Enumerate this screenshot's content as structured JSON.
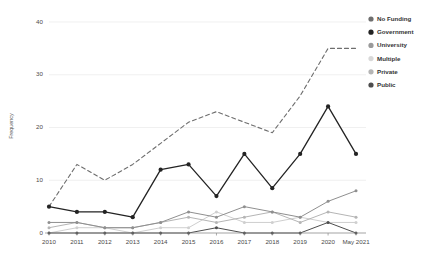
{
  "chart_data": {
    "type": "line",
    "title": "",
    "xlabel": "",
    "ylabel": "Frequency",
    "categories": [
      "2010",
      "2011",
      "2012",
      "2013",
      "2014",
      "2015",
      "2016",
      "2017",
      "2018",
      "2019",
      "2020",
      "May 2021"
    ],
    "ylim": [
      0,
      42
    ],
    "yticks": [
      0,
      10,
      20,
      30,
      40
    ],
    "ytick_labels": [
      "0",
      "10",
      "20",
      "30",
      "40"
    ],
    "grid": true,
    "legend_position": "right",
    "series": [
      {
        "name": "No Funding",
        "color": "#6e6e6e",
        "dash": "4,3",
        "width": 1.1,
        "marker": "none",
        "values": [
          5,
          13,
          10,
          13,
          17,
          21,
          23,
          21,
          19,
          26,
          35,
          35
        ]
      },
      {
        "name": "Government",
        "color": "#232323",
        "dash": "none",
        "width": 1.3,
        "marker": "circle",
        "values": [
          5,
          4,
          4,
          3,
          12,
          13,
          7,
          15,
          8.5,
          15,
          24,
          15
        ]
      },
      {
        "name": "University",
        "color": "#8f8f8f",
        "dash": "none",
        "width": 1.0,
        "marker": "circle",
        "values": [
          2,
          2,
          1,
          1,
          2,
          4,
          3,
          5,
          4,
          3,
          6,
          8
        ]
      },
      {
        "name": "Multiple",
        "color": "#cfcfcf",
        "dash": "none",
        "width": 1.0,
        "marker": "circle",
        "values": [
          0,
          1,
          1,
          0,
          1,
          1,
          4,
          2,
          2,
          3,
          2,
          2
        ]
      },
      {
        "name": "Private",
        "color": "#b5b5b5",
        "dash": "none",
        "width": 1.0,
        "marker": "circle",
        "values": [
          1,
          2,
          1,
          1,
          2,
          3,
          2,
          3,
          4,
          2,
          4,
          3
        ]
      },
      {
        "name": "Public",
        "color": "#4d4d4d",
        "dash": "none",
        "width": 1.0,
        "marker": "circle",
        "values": [
          0,
          0,
          0,
          0,
          0,
          0,
          1,
          0,
          0,
          0,
          2,
          0
        ]
      }
    ]
  },
  "legend": {
    "items": [
      {
        "label": "No Funding",
        "color": "#6e6e6e"
      },
      {
        "label": "Government",
        "color": "#232323"
      },
      {
        "label": "University",
        "color": "#9a9a9a"
      },
      {
        "label": "Multiple",
        "color": "#d8d8d8"
      },
      {
        "label": "Private",
        "color": "#b5b5b5"
      },
      {
        "label": "Public",
        "color": "#4d4d4d"
      }
    ]
  }
}
